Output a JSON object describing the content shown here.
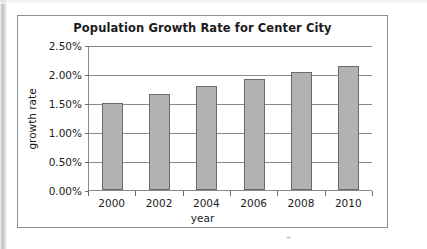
{
  "chart_data": {
    "type": "bar",
    "title": "Population Growth Rate for Center City",
    "xlabel": "year",
    "ylabel": "growth rate",
    "categories": [
      "2000",
      "2002",
      "2004",
      "2006",
      "2008",
      "2010"
    ],
    "values": [
      1.5,
      1.66,
      1.8,
      1.92,
      2.03,
      2.13
    ],
    "value_unit": "%",
    "ylim": [
      0.0,
      2.5
    ],
    "ytick_labels": [
      "2.50%",
      "2.00%",
      "1.50%",
      "1.00%",
      "0.50%",
      "0.00%"
    ],
    "ytick_values": [
      2.5,
      2.0,
      1.5,
      1.0,
      0.5,
      0.0
    ],
    "grid": true,
    "legend": null,
    "bar_color": "#b2b2b2",
    "bar_border_color": "#6a6a6a",
    "grid_color": "#8a8a8a",
    "frame_color": "#8e8e8e",
    "text_color": "#1b1b1b"
  }
}
